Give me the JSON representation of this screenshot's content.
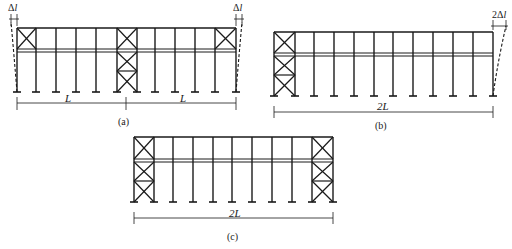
{
  "figure": {
    "stroke_color": "#1a1a1a",
    "background": "#ffffff",
    "panels": [
      {
        "id": "a",
        "caption": "(a)",
        "dimension_labels": [
          "L",
          "L"
        ],
        "deformation_label_left": "Δl",
        "deformation_label_right": "Δl",
        "description": "Two-span frame, bracing at both ends (top bay) and full-height bracing at middle; free expansion Δl at each end"
      },
      {
        "id": "b",
        "caption": "(b)",
        "dimension_labels": [
          "2L"
        ],
        "deformation_label_right": "2Δl",
        "description": "Frame braced full-height at left end only; expansion 2Δl at free right end"
      },
      {
        "id": "c",
        "caption": "(c)",
        "dimension_labels": [
          "2L"
        ],
        "description": "Frame braced full-height at both ends; no free expansion"
      }
    ]
  }
}
